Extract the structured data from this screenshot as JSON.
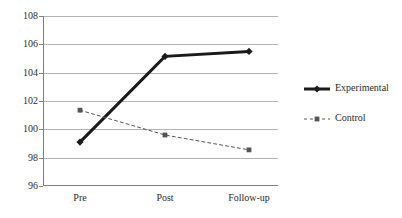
{
  "chart_data": {
    "type": "line",
    "title": "",
    "subtitle": "",
    "xlabel": "",
    "ylabel": "",
    "categories": [
      "Pre",
      "Post",
      "Follow-up"
    ],
    "series": [
      {
        "name": "Experimental",
        "values": [
          99.1,
          105.15,
          105.5
        ],
        "color": "#1a1a1a",
        "line_style": "solid",
        "line_width": 3,
        "marker": "diamond"
      },
      {
        "name": "Control",
        "values": [
          101.35,
          99.6,
          98.55
        ],
        "color": "#555555",
        "line_style": "dashed",
        "line_width": 1,
        "marker": "square"
      }
    ],
    "ylim": [
      96,
      108
    ],
    "ytick_step": 2,
    "yticks": [
      96,
      98,
      100,
      102,
      104,
      106,
      108
    ],
    "ytick_labels": [
      "96",
      "98",
      "100",
      "102",
      "104",
      "106",
      "108"
    ],
    "grid": true,
    "grid_axis": "y",
    "grid_color": "#b4b4b4",
    "axis_color": "#808080",
    "legend": {
      "position": "right",
      "entries": [
        {
          "label": "Experimental",
          "marker": "diamond",
          "line_style": "solid"
        },
        {
          "label": "Control",
          "marker": "square",
          "line_style": "dashed"
        }
      ]
    },
    "background": "#ffffff"
  }
}
